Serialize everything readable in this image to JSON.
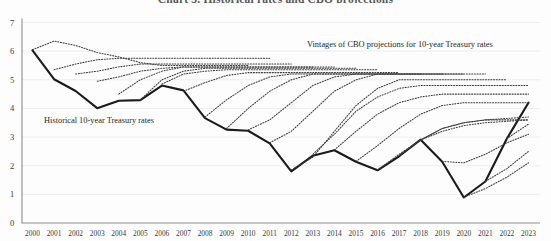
{
  "title": "Chart 3. Historical rates and CBO projections",
  "annotations": {
    "projections_label": "Vintages of CBO projections for 10-year Treasury rates",
    "historical_label": "Historical 10-year Treasury rates"
  },
  "chart_data": {
    "type": "line",
    "title": "Chart 3. Historical rates and CBO projections",
    "xlabel": "",
    "ylabel": "",
    "xlim": [
      2000,
      2023
    ],
    "ylim": [
      0,
      7
    ],
    "yticks": [
      0,
      1,
      2,
      3,
      4,
      5,
      6,
      7
    ],
    "xticks": [
      2000,
      2001,
      2002,
      2003,
      2004,
      2005,
      2006,
      2007,
      2008,
      2009,
      2010,
      2011,
      2012,
      2013,
      2014,
      2015,
      2016,
      2017,
      2018,
      2019,
      2020,
      2021,
      2022,
      2023
    ],
    "grid": true,
    "legend_position": "inline-annotations",
    "colors": {
      "historical": "#1b1b1b",
      "projection": "#3d3d3d",
      "gridline": "#e8e8ea",
      "axis": "#8d8d92"
    },
    "series": [
      {
        "name": "Historical 10-year Treasury rates",
        "style": "solid",
        "x": [
          2000,
          2001,
          2002,
          2003,
          2004,
          2005,
          2006,
          2007,
          2008,
          2009,
          2010,
          2011,
          2012,
          2013,
          2014,
          2015,
          2016,
          2017,
          2018,
          2019,
          2020,
          2021,
          2022,
          2023
        ],
        "values": [
          6.03,
          5.02,
          4.61,
          4.01,
          4.27,
          4.29,
          4.8,
          4.63,
          3.66,
          3.26,
          3.22,
          2.78,
          1.8,
          2.35,
          2.54,
          2.14,
          1.84,
          2.33,
          2.91,
          2.14,
          0.89,
          1.45,
          2.95,
          4.2
        ]
      },
      {
        "name": "CBO projection vintage 2000",
        "style": "dotted",
        "x": [
          2000,
          2001,
          2002,
          2003,
          2004,
          2005,
          2006,
          2007,
          2008,
          2009,
          2010
        ],
        "values": [
          6.05,
          6.35,
          6.2,
          5.95,
          5.8,
          5.6,
          5.5,
          5.5,
          5.5,
          5.5,
          5.5
        ]
      },
      {
        "name": "CBO projection vintage 2001",
        "style": "dotted",
        "x": [
          2001,
          2002,
          2003,
          2004,
          2005,
          2006,
          2007,
          2008,
          2009,
          2010,
          2011
        ],
        "values": [
          5.35,
          5.55,
          5.7,
          5.75,
          5.75,
          5.75,
          5.75,
          5.75,
          5.75,
          5.75,
          5.75
        ]
      },
      {
        "name": "CBO projection vintage 2002",
        "style": "dotted",
        "x": [
          2002,
          2003,
          2004,
          2005,
          2006,
          2007,
          2008,
          2009,
          2010,
          2011,
          2012
        ],
        "values": [
          5.2,
          5.3,
          5.45,
          5.55,
          5.55,
          5.55,
          5.55,
          5.55,
          5.55,
          5.55,
          5.55
        ]
      },
      {
        "name": "CBO projection vintage 2003",
        "style": "dotted",
        "x": [
          2003,
          2004,
          2005,
          2006,
          2007,
          2008,
          2009,
          2010,
          2011,
          2012,
          2013
        ],
        "values": [
          4.95,
          5.1,
          5.3,
          5.4,
          5.45,
          5.45,
          5.45,
          5.45,
          5.45,
          5.45,
          5.45
        ]
      },
      {
        "name": "CBO projection vintage 2004",
        "style": "dotted",
        "x": [
          2004,
          2005,
          2006,
          2007,
          2008,
          2009,
          2010,
          2011,
          2012,
          2013,
          2014
        ],
        "values": [
          4.5,
          5.0,
          5.3,
          5.45,
          5.45,
          5.45,
          5.45,
          5.45,
          5.45,
          5.45,
          5.45
        ]
      },
      {
        "name": "CBO projection vintage 2005",
        "style": "dotted",
        "x": [
          2005,
          2006,
          2007,
          2008,
          2009,
          2010,
          2011,
          2012,
          2013,
          2014,
          2015
        ],
        "values": [
          4.3,
          5.0,
          5.3,
          5.4,
          5.4,
          5.4,
          5.4,
          5.4,
          5.4,
          5.4,
          5.4
        ]
      },
      {
        "name": "CBO projection vintage 2006",
        "style": "dotted",
        "x": [
          2006,
          2007,
          2008,
          2009,
          2010,
          2011,
          2012,
          2013,
          2014,
          2015,
          2016
        ],
        "values": [
          4.85,
          5.2,
          5.3,
          5.35,
          5.35,
          5.35,
          5.35,
          5.35,
          5.35,
          5.35,
          5.35
        ]
      },
      {
        "name": "CBO projection vintage 2007",
        "style": "dotted",
        "x": [
          2007,
          2008,
          2009,
          2010,
          2011,
          2012,
          2013,
          2014,
          2015,
          2016,
          2017
        ],
        "values": [
          4.6,
          4.9,
          5.15,
          5.25,
          5.25,
          5.25,
          5.25,
          5.25,
          5.25,
          5.25,
          5.25
        ]
      },
      {
        "name": "CBO projection vintage 2008",
        "style": "dotted",
        "x": [
          2008,
          2009,
          2010,
          2011,
          2012,
          2013,
          2014,
          2015,
          2016,
          2017,
          2018
        ],
        "values": [
          3.7,
          4.3,
          4.8,
          5.1,
          5.2,
          5.2,
          5.2,
          5.2,
          5.2,
          5.2,
          5.2
        ]
      },
      {
        "name": "CBO projection vintage 2009",
        "style": "dotted",
        "x": [
          2009,
          2010,
          2011,
          2012,
          2013,
          2014,
          2015,
          2016,
          2017,
          2018,
          2019
        ],
        "values": [
          3.3,
          4.0,
          4.6,
          5.0,
          5.2,
          5.2,
          5.2,
          5.2,
          5.2,
          5.2,
          5.2
        ]
      },
      {
        "name": "CBO projection vintage 2010",
        "style": "dotted",
        "x": [
          2010,
          2011,
          2012,
          2013,
          2014,
          2015,
          2016,
          2017,
          2018,
          2019,
          2020
        ],
        "values": [
          3.25,
          3.6,
          4.2,
          4.8,
          5.1,
          5.2,
          5.2,
          5.2,
          5.2,
          5.2,
          5.2
        ]
      },
      {
        "name": "CBO projection vintage 2011",
        "style": "dotted",
        "x": [
          2011,
          2012,
          2013,
          2014,
          2015,
          2016,
          2017,
          2018,
          2019,
          2020,
          2021
        ],
        "values": [
          2.8,
          3.2,
          3.9,
          4.6,
          5.0,
          5.2,
          5.2,
          5.2,
          5.2,
          5.2,
          5.2
        ]
      },
      {
        "name": "CBO projection vintage 2012",
        "style": "dotted",
        "x": [
          2012,
          2013,
          2014,
          2015,
          2016,
          2017,
          2018,
          2019,
          2020,
          2021,
          2022
        ],
        "values": [
          1.85,
          2.3,
          3.2,
          4.1,
          4.7,
          5.0,
          5.0,
          5.0,
          5.0,
          5.0,
          5.0
        ]
      },
      {
        "name": "CBO projection vintage 2013",
        "style": "dotted",
        "x": [
          2013,
          2014,
          2015,
          2016,
          2017,
          2018,
          2019,
          2020,
          2021,
          2022,
          2023
        ],
        "values": [
          2.4,
          3.1,
          3.9,
          4.4,
          4.7,
          4.8,
          4.8,
          4.8,
          4.8,
          4.8,
          4.8
        ]
      },
      {
        "name": "CBO projection vintage 2014",
        "style": "dotted",
        "x": [
          2014,
          2015,
          2016,
          2017,
          2018,
          2019,
          2020,
          2021,
          2022,
          2023
        ],
        "values": [
          2.55,
          3.2,
          3.8,
          4.2,
          4.4,
          4.5,
          4.5,
          4.5,
          4.5,
          4.5
        ]
      },
      {
        "name": "CBO projection vintage 2015",
        "style": "dotted",
        "x": [
          2015,
          2016,
          2017,
          2018,
          2019,
          2020,
          2021,
          2022,
          2023
        ],
        "values": [
          2.15,
          2.7,
          3.3,
          3.8,
          4.1,
          4.2,
          4.2,
          4.2,
          4.2
        ]
      },
      {
        "name": "CBO projection vintage 2016",
        "style": "dotted",
        "x": [
          2016,
          2017,
          2018,
          2019,
          2020,
          2021,
          2022,
          2023
        ],
        "values": [
          1.85,
          2.4,
          2.9,
          3.3,
          3.5,
          3.6,
          3.6,
          3.6
        ]
      },
      {
        "name": "CBO projection vintage 2017",
        "style": "dotted",
        "x": [
          2017,
          2018,
          2019,
          2020,
          2021,
          2022,
          2023
        ],
        "values": [
          2.35,
          2.9,
          3.3,
          3.5,
          3.6,
          3.65,
          3.7
        ]
      },
      {
        "name": "CBO projection vintage 2018",
        "style": "dotted",
        "x": [
          2018,
          2019,
          2020,
          2021,
          2022,
          2023
        ],
        "values": [
          2.9,
          3.2,
          3.4,
          3.5,
          3.55,
          3.6
        ]
      },
      {
        "name": "CBO projection vintage 2019",
        "style": "dotted",
        "x": [
          2019,
          2020,
          2021,
          2022,
          2023
        ],
        "values": [
          2.15,
          2.1,
          2.4,
          2.8,
          3.1
        ]
      },
      {
        "name": "CBO projection vintage 2020",
        "style": "dotted",
        "x": [
          2020,
          2021,
          2022,
          2023
        ],
        "values": [
          0.9,
          1.2,
          1.6,
          2.1
        ]
      },
      {
        "name": "CBO projection vintage 2021",
        "style": "dotted",
        "x": [
          2021,
          2022,
          2023
        ],
        "values": [
          1.45,
          1.9,
          2.5
        ]
      },
      {
        "name": "CBO projection vintage 2022",
        "style": "dotted",
        "x": [
          2022,
          2023
        ],
        "values": [
          2.95,
          3.45
        ]
      },
      {
        "name": "CBO projection vintage 2023",
        "style": "dotted",
        "x": [
          2023
        ],
        "values": [
          4.2
        ]
      }
    ]
  }
}
